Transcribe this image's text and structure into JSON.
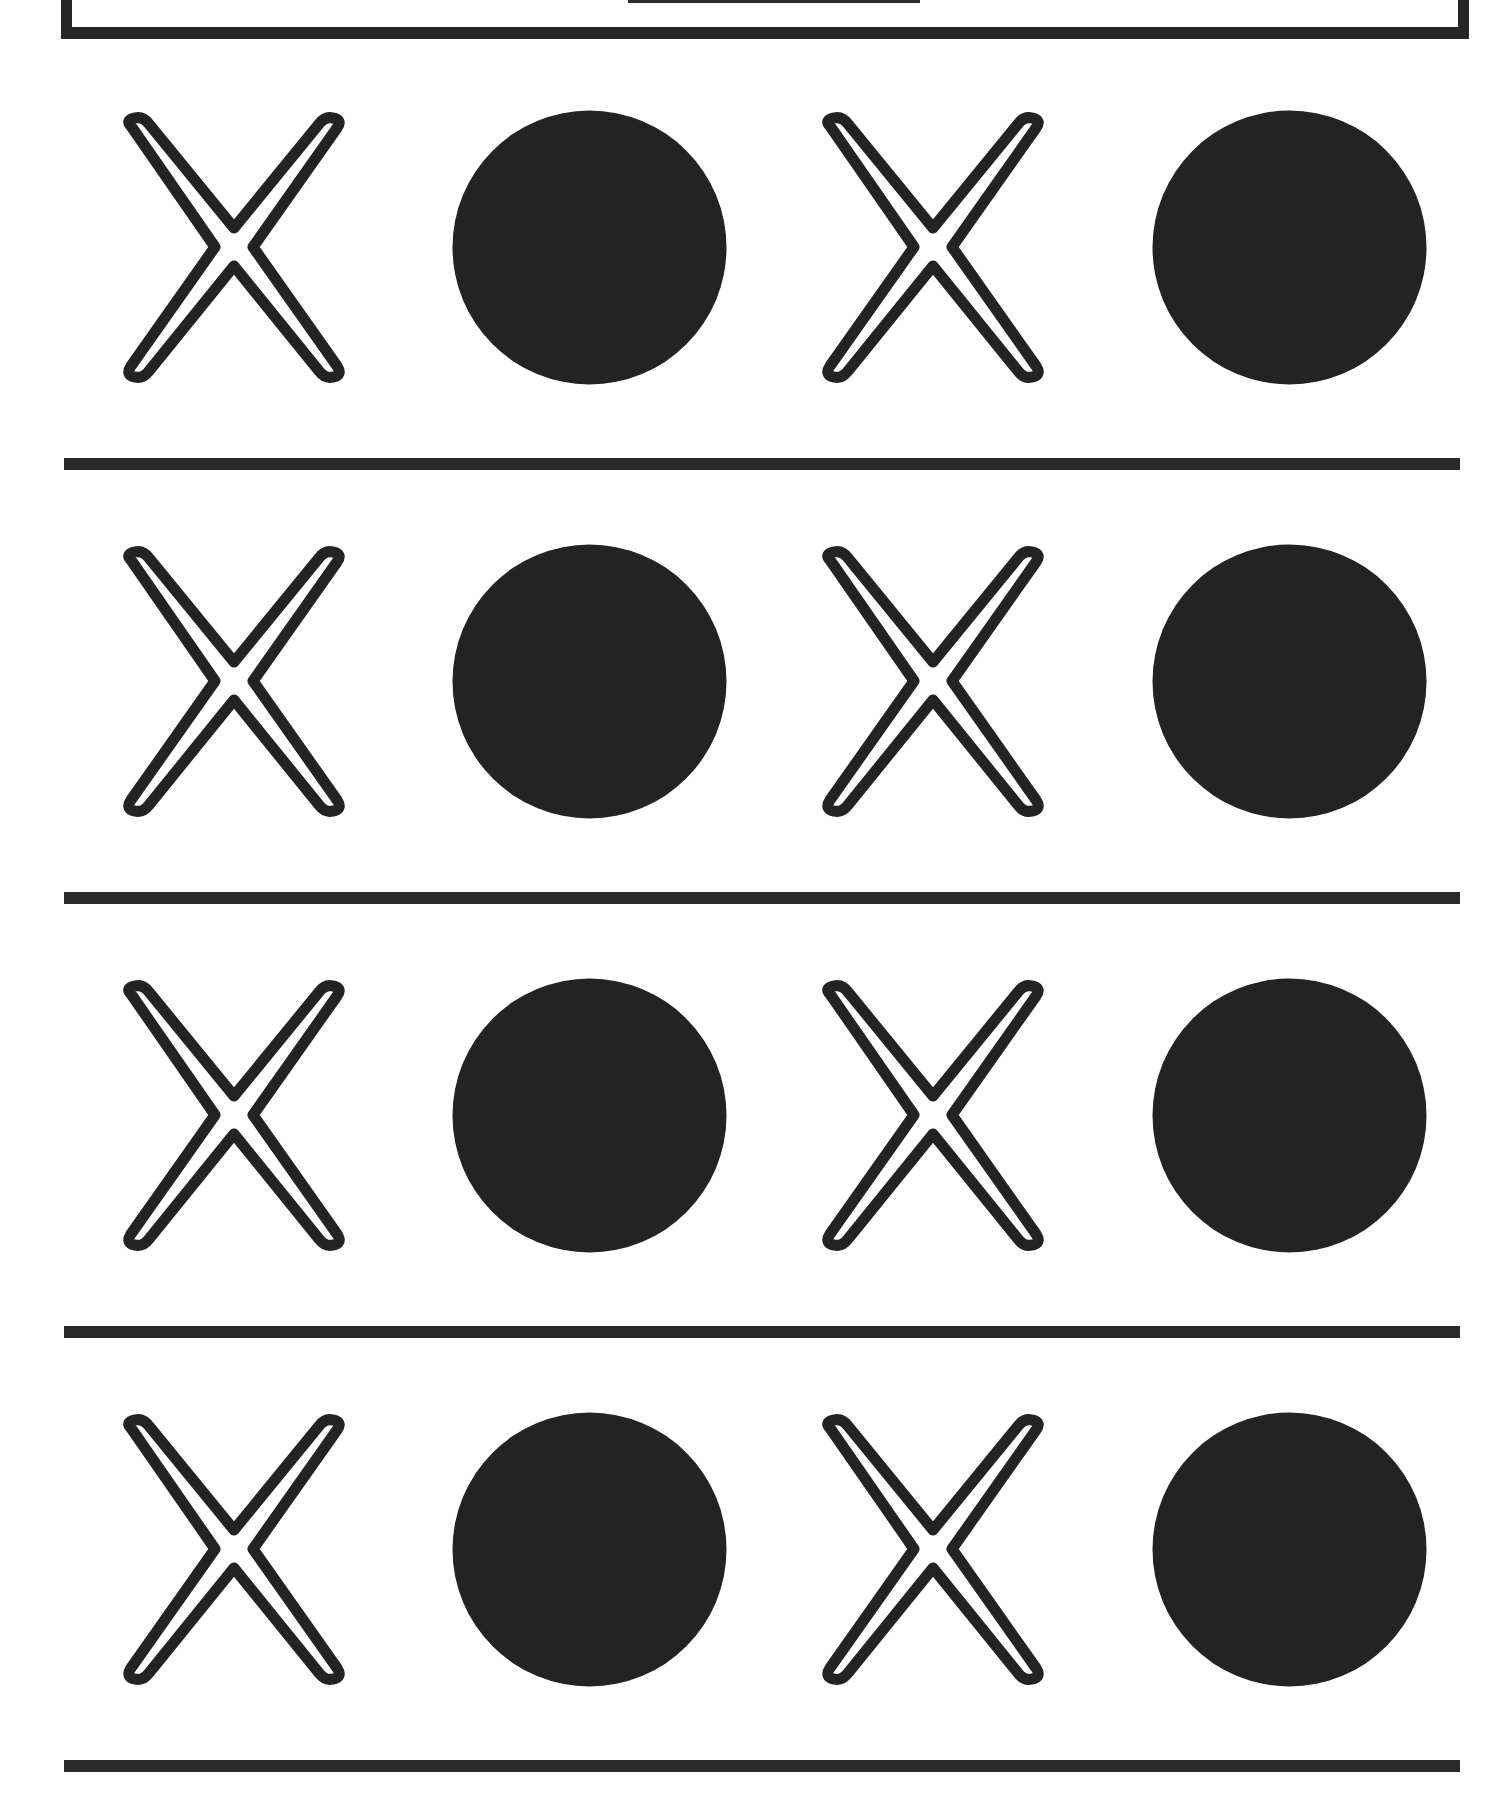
{
  "worksheet": {
    "header": {
      "title": ""
    },
    "pattern": [
      "x",
      "circle",
      "x",
      "circle"
    ],
    "rows": [
      {
        "items": [
          {
            "type": "x",
            "icon": "outlined-x-icon"
          },
          {
            "type": "circle",
            "icon": "filled-circle-icon"
          },
          {
            "type": "x",
            "icon": "outlined-x-icon"
          },
          {
            "type": "circle",
            "icon": "filled-circle-icon"
          }
        ]
      },
      {
        "items": [
          {
            "type": "x",
            "icon": "outlined-x-icon"
          },
          {
            "type": "circle",
            "icon": "filled-circle-icon"
          },
          {
            "type": "x",
            "icon": "outlined-x-icon"
          },
          {
            "type": "circle",
            "icon": "filled-circle-icon"
          }
        ]
      },
      {
        "items": [
          {
            "type": "x",
            "icon": "outlined-x-icon"
          },
          {
            "type": "circle",
            "icon": "filled-circle-icon"
          },
          {
            "type": "x",
            "icon": "outlined-x-icon"
          },
          {
            "type": "circle",
            "icon": "filled-circle-icon"
          }
        ]
      },
      {
        "items": [
          {
            "type": "x",
            "icon": "outlined-x-icon"
          },
          {
            "type": "circle",
            "icon": "filled-circle-icon"
          },
          {
            "type": "x",
            "icon": "outlined-x-icon"
          },
          {
            "type": "circle",
            "icon": "filled-circle-icon"
          }
        ]
      }
    ],
    "colors": {
      "ink": "#232323",
      "paper": "#ffffff",
      "rule": "#2a2a2a"
    }
  }
}
